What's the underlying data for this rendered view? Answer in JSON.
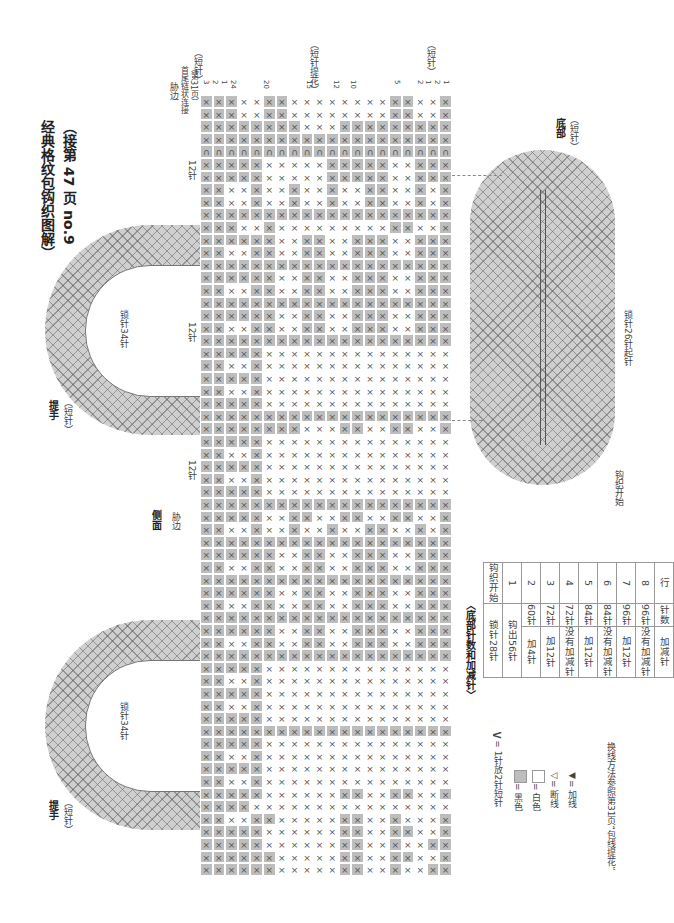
{
  "title": {
    "line1": "（接第 47 页 no.9",
    "line2": "经典格纹包钩织图解）"
  },
  "top_labels": {
    "left_bracket": "（短针）",
    "middle_bracket": "（短针提花）",
    "right_bracket": "（短针）",
    "rib_edge": "胁边",
    "join_note_1": "首尾链状连接",
    "join_note_2": "（第31页）",
    "row_numbers": [
      "3",
      "2",
      "1",
      "24",
      "20",
      "15",
      "12",
      "10",
      "5",
      "2",
      "1",
      "2",
      "1"
    ]
  },
  "side_labels": {
    "side_panel": "侧面",
    "rib_edge": "胁边",
    "stitches_12": "12针"
  },
  "handles": [
    {
      "label": "提手",
      "sub": "（短针）",
      "chain": "锁针34针",
      "rows": [
        "1",
        "2",
        "5"
      ]
    },
    {
      "label": "提手",
      "sub": "（短针）",
      "chain": "锁针34针",
      "rows": [
        "1",
        "2",
        "5"
      ]
    }
  ],
  "bottom": {
    "label": "底部",
    "sub": "（短针）",
    "chain_start": "锁针26针起针",
    "start_label": "钩织开始"
  },
  "table": {
    "title": "〈底部针数和加减针〉",
    "headers": [
      "行",
      "针数",
      "加减针"
    ],
    "rows": [
      [
        "8",
        "96针",
        "没有加减针"
      ],
      [
        "7",
        "96针",
        "加12针"
      ],
      [
        "6",
        "84针",
        "没有加减针"
      ],
      [
        "5",
        "84针",
        "加12针"
      ],
      [
        "4",
        "72针",
        "没有加减针"
      ],
      [
        "3",
        "72针",
        "加12针"
      ],
      [
        "2",
        "60针",
        "加4针"
      ],
      [
        "1",
        "钩出56针",
        ""
      ],
      [
        "钩织开始",
        "锁针28针",
        ""
      ]
    ]
  },
  "legend": {
    "increase": "= 1针放2针短针",
    "black": "= 黑色",
    "white": "= 白色",
    "cut": "= 断线",
    "join": "= 加线",
    "note": "换线方法参照第31页“包线提花”"
  },
  "colors": {
    "dark_cell": "#bdbdbd",
    "light_cell": "#ffffff",
    "stitch_mark": "#555555"
  },
  "grid": {
    "columns": 20,
    "rows": [
      "DDDLLDDLLLLLLLLDDLLD",
      "DDDLLDDLLLLLLLLDDLLD",
      "DDDDDDDDLLLDDDDDDDDD",
      "DDDDDDDDDDDDDDDDDDDD",
      "CCCCCCCCCCCCCCCCCCCC",
      "DDDDDLLLLLDDDDDLLDDD",
      "DDDDDLLLLLDDDDDLLDDD",
      "DDLLDLLDLLDLLDDLLDLD",
      "DDLLDLLDLLDLLDDLLDLD",
      "DDDDDDDDDDDDDDDDDDDD",
      "DDDLLDLLLLLLLLLDDLLD",
      "DDDDDDLLDDLLDDDLLDDD",
      "DDLLDDLLDDLLDDDLLDDD",
      "DDDDDDDDDDDDDDDDDDDD",
      "DDDDDDLLDDLLDDDLLDDD",
      "DDLLDDLLDDLLDDDLLDDD",
      "DDDDDDDDDDDDDDDDDDDD",
      "DDDDDDLLDDLLDDDLLDDD",
      "DDLLDDLLDDLLDDDLLDDD",
      "DDDDDDDDDDDDDDDDDDDD",
      "DDDDDLLLLLLLLLLLLLLL",
      "DDLLDLLLLLLLLLLLLLLL",
      "DDDDDLLLLLLLLLLLLLLL",
      "DDLLDLLLLLLLLLLLLLLL",
      "DDDDDLLLLLLLLLLLLLLL",
      "DDDDDDDDDDDDDDDDDDDD",
      "DDDDDDDDLLLDDLLDDLLD",
      "DDDDDLLLLLLLLLLLLLLL",
      "DDLLDLLLLLLLLLLLLLLL",
      "DDDDDLLLLLLLLLLLLLLL",
      "DDLLDLLLLLLLLLLLLLLL",
      "DDDDDLLLLLLLLLLLLLLL",
      "DDDDDDDDDDDDDDDDDDDD",
      "DDDDDLLDDLLDDLLDDLLD",
      "DDLLDLLDLLDLLDDLLDLD",
      "DDDDDDDDDDDDDDDDDDDD",
      "DDDDDDLLDDLLDDDLLDDD",
      "DDLLDDLLDDLLDDDLLDDD",
      "DDDDDDDDDDDDDDDDDDDD",
      "DDDDDDLLDDLLDDDLLDDD",
      "DDLLDDLLDDLLDDDLLDDD",
      "DDDDDDDDDDDDDDDDDDDD",
      "DDDDDDLLDDLLDDDLLDDD",
      "DDLLDDLLDDLLDDDLLDDD",
      "DDDDDDDDDDDDDDDDDDDD",
      "DDDDDLLLLLLLLLLLLLLL",
      "DDLLDLLLLLLLLLLLLLLL",
      "DDDDDLLLLLLLLLLLLLLL",
      "DDLLDLLLLLLLLLLLLLLL",
      "DDDDDLLLLLLLLLLLLLLL",
      "DDDDDDDDDDDDDDDDDDDD",
      "DDDDDLLLLLLLLLLLLLLL",
      "DDLLDLLLLLLLLLLLLLLL",
      "DDDDDLLLLLLLLLLLLLLL",
      "DDLLDLLLLLLLLLLLLLLL",
      "DDDDDLLLLLLDDLLDDLLD",
      "DDDDLLLLLLLLLLLLLLLL",
      "DDLLDDLLLLLDDLLDLLLD",
      "DDDDDLLLLLLDDLLDDLLD",
      "DDDDDLLLLLLDDLLDLLDD",
      "DDDDDDLLLLLDDLLDDLLD",
      "DDDDDDLLLLLDDLLDLLDD"
    ]
  }
}
